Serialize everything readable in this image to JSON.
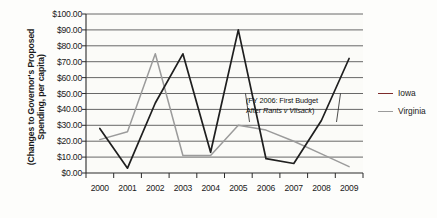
{
  "axis": {
    "y_title": "(Changes to Governor's Proposed Spending, per capita)",
    "y_ticks": [
      "$100.00",
      "$90.00",
      "$80.00",
      "$70.00",
      "$60.00",
      "$50.00",
      "$40.00",
      "$30.00",
      "$20.00",
      "$10.00",
      "$0.00"
    ],
    "x_ticks": [
      "2000",
      "2001",
      "2002",
      "2003",
      "2004",
      "2005",
      "2006",
      "2007",
      "2008",
      "2009"
    ]
  },
  "legend": {
    "items": [
      {
        "label": "Iowa",
        "color": "#7d2b2b"
      },
      {
        "label": "Virginia",
        "color": "#9b9b9b"
      }
    ]
  },
  "annotation": {
    "line1": "(FY 2006: First Budget",
    "line2_prefix": "After ",
    "line2_italic": "Rants v Vilsack",
    "line2_suffix": ")"
  },
  "chart_data": {
    "type": "line",
    "title": "",
    "xlabel": "",
    "ylabel": "(Changes to Governor's Proposed Spending, per capita)",
    "categories": [
      "2000",
      "2001",
      "2002",
      "2003",
      "2004",
      "2005",
      "2006",
      "2007",
      "2008",
      "2009"
    ],
    "x": [
      2000,
      2001,
      2002,
      2003,
      2004,
      2005,
      2006,
      2007,
      2008,
      2009
    ],
    "ylim": [
      0,
      100
    ],
    "ytick_values": [
      0,
      10,
      20,
      30,
      40,
      50,
      60,
      70,
      80,
      90,
      100
    ],
    "ytick_step": 10,
    "grid": "horizontal",
    "legend_position": "right",
    "value_prefix": "$",
    "series": [
      {
        "name": "Iowa",
        "color": "#1f1f1f",
        "legend_color": "#7d2b2b",
        "values": [
          28.0,
          3.0,
          44.0,
          75.0,
          13.0,
          90.0,
          9.0,
          6.0,
          33.0,
          72.0
        ]
      },
      {
        "name": "Virginia",
        "color": "#9b9b9b",
        "legend_color": "#9b9b9b",
        "values": [
          21.0,
          26.0,
          75.0,
          11.0,
          11.0,
          30.0,
          27.0,
          20.0,
          12.0,
          4.0
        ]
      }
    ],
    "annotations": [
      {
        "text": "(FY 2006: First Budget After Rants v Vilsack)",
        "target_x": 2006,
        "target_series": "Iowa"
      }
    ]
  }
}
